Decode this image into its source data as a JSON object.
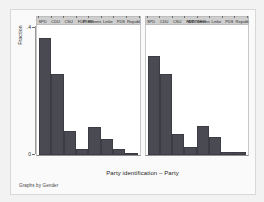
{
  "chart_data": {
    "type": "bar",
    "title": "",
    "xlabel": "Party identification – Party",
    "ylabel": "Fraction",
    "note": "Graphs by Gender",
    "ylim": [
      0,
      0.4
    ],
    "ytick_labels": [
      ".4",
      "0"
    ],
    "grid": false,
    "legend_position": "none",
    "facet_by": "Gender",
    "categories": [
      "SPD",
      "CDU",
      "CSU",
      "FDP",
      "Greens",
      "Linke",
      "PDS",
      "Republ."
    ],
    "panels": [
      {
        "label": "men",
        "values": [
          0.36,
          0.25,
          0.075,
          0.02,
          0.085,
          0.05,
          0.02,
          0.005
        ]
      },
      {
        "label": "women",
        "values": [
          0.305,
          0.25,
          0.065,
          0.025,
          0.09,
          0.055,
          0.01,
          0.008
        ]
      }
    ],
    "colors": {
      "bar": "#4a4a52",
      "panel_title_bg": "#cfcfcf",
      "plot_bg": "#ffffff",
      "graph_bg": "#fafafa",
      "outer_bg": "#f2f2f2"
    }
  }
}
